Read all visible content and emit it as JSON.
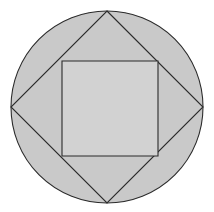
{
  "figure": {
    "canvas": {
      "width": 214,
      "height": 212,
      "background_color": "#ffffff"
    },
    "colors": {
      "circle_fill": "#c9c9c9",
      "diamond_fill": "#c9c9c9",
      "inner_square_fill": "#d2d2d2",
      "stroke": "#2b2b2b",
      "background": "#ffffff"
    },
    "shapes": {
      "circle": {
        "name": "outer-circle",
        "center_x": 107,
        "center_y": 107,
        "radius": 96,
        "fill": "#c9c9c9",
        "stroke": "#2b2b2b",
        "stroke_width": 1.1
      },
      "diamond": {
        "name": "inscribed-rotated-square",
        "points": "107,11 203,107 107,203 11,107",
        "vertex_top": {
          "x": 107,
          "y": 11
        },
        "vertex_right": {
          "x": 203,
          "y": 107
        },
        "vertex_bottom": {
          "x": 107,
          "y": 203
        },
        "vertex_left": {
          "x": 11,
          "y": 107
        },
        "fill": "#c9c9c9",
        "stroke": "#2b2b2b",
        "stroke_width": 1.1
      },
      "inner_square": {
        "name": "inner-axis-aligned-square",
        "x": 62,
        "y": 61,
        "width": 96,
        "height": 95,
        "corner_top_left": {
          "x": 62,
          "y": 61
        },
        "corner_top_right": {
          "x": 158,
          "y": 61
        },
        "corner_bottom_right": {
          "x": 158,
          "y": 156
        },
        "corner_bottom_left": {
          "x": 62,
          "y": 156
        },
        "fill": "#d2d2d2",
        "stroke": "#2b2b2b",
        "stroke_width": 1.1
      }
    }
  }
}
